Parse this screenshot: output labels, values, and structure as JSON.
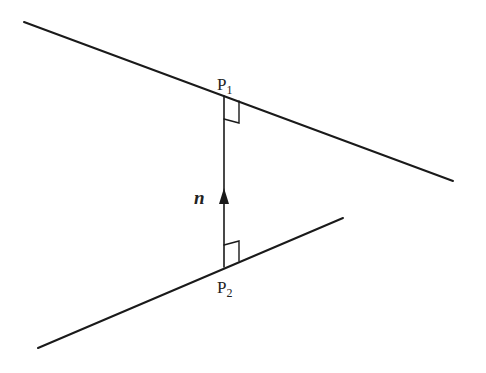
{
  "diagram": {
    "labels": {
      "p1": {
        "base": "P",
        "sub": "1"
      },
      "p2": {
        "base": "P",
        "sub": "2"
      },
      "vector": "n"
    },
    "colors": {
      "stroke": "#1a1a1a",
      "background": "#ffffff"
    }
  }
}
